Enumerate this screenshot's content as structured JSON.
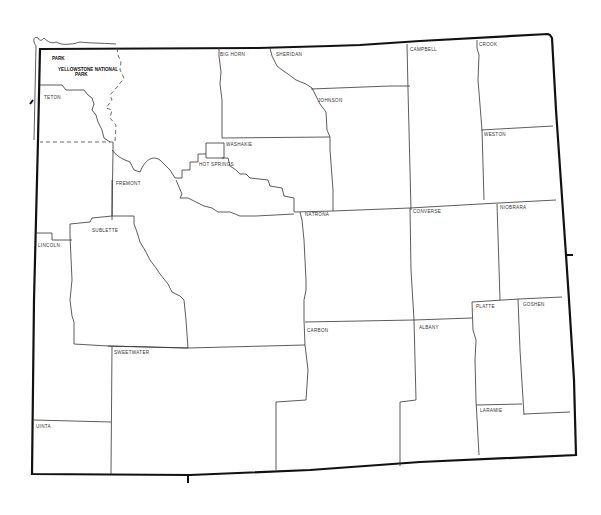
{
  "map": {
    "title": "Wyoming county outline map",
    "counties": [
      {
        "name": "PARK",
        "x": 52,
        "y": 60
      },
      {
        "name": "YELLOWSTONE NATIONAL",
        "x": 58,
        "y": 70
      },
      {
        "name": "PARK_SUB",
        "label": "PARK",
        "x": 75,
        "y": 75
      },
      {
        "name": "TETON",
        "x": 44,
        "y": 98
      },
      {
        "name": "BIG HORN",
        "x": 220,
        "y": 54
      },
      {
        "name": "SHERIDAN",
        "x": 276,
        "y": 54
      },
      {
        "name": "CAMPBELL",
        "x": 410,
        "y": 50
      },
      {
        "name": "CROOK",
        "x": 479,
        "y": 45
      },
      {
        "name": "JOHNSON",
        "x": 318,
        "y": 100
      },
      {
        "name": "WESTON",
        "x": 483,
        "y": 135
      },
      {
        "name": "WASHAKIE",
        "x": 225,
        "y": 145
      },
      {
        "name": "HOT SPRINGS",
        "x": 199,
        "y": 166
      },
      {
        "name": "FREMONT",
        "x": 116,
        "y": 184
      },
      {
        "name": "NATRONA",
        "x": 306,
        "y": 215
      },
      {
        "name": "CONVERSE",
        "x": 413,
        "y": 212
      },
      {
        "name": "NIOBRARA",
        "x": 500,
        "y": 208
      },
      {
        "name": "SUBLETTE",
        "x": 92,
        "y": 231
      },
      {
        "name": "LINCOLN",
        "x": 38,
        "y": 246
      },
      {
        "name": "PLATTE",
        "x": 477,
        "y": 307
      },
      {
        "name": "GOSHEN",
        "x": 523,
        "y": 305
      },
      {
        "name": "CARBON",
        "x": 307,
        "y": 332
      },
      {
        "name": "ALBANY",
        "x": 420,
        "y": 328
      },
      {
        "name": "SWEETWATER",
        "x": 114,
        "y": 353
      },
      {
        "name": "LARAMIE",
        "x": 480,
        "y": 411
      },
      {
        "name": "UINTA",
        "x": 37,
        "y": 427
      }
    ]
  }
}
